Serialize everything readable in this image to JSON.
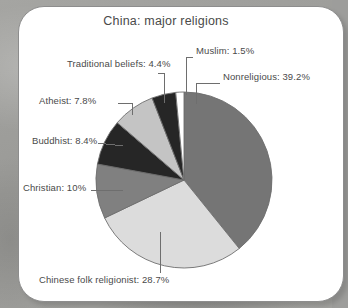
{
  "chart_data": {
    "type": "pie",
    "title": "China: major religions",
    "xlabel": "",
    "ylabel": "",
    "units": "percent",
    "legend_position": "none-callout-labels",
    "grid": false,
    "start_angle_deg": 0,
    "direction": "clockwise",
    "categories": [
      "Nonreligious",
      "Chinese folk religionist",
      "Christian",
      "Buddhist",
      "Atheist",
      "Traditional beliefs",
      "Muslim"
    ],
    "values": [
      39.2,
      28.7,
      10,
      8.4,
      7.8,
      4.4,
      1.5
    ],
    "slices": [
      {
        "label": "Nonreligious",
        "value": 39.2,
        "value_text": "39.2%",
        "callout": "Nonreligious: 39.2%",
        "color": "#757575"
      },
      {
        "label": "Chinese folk religionist",
        "value": 28.7,
        "value_text": "28.7%",
        "callout": "Chinese folk religionist: 28.7%",
        "color": "#dcdcdc"
      },
      {
        "label": "Christian",
        "value": 10,
        "value_text": "10%",
        "callout": "Christian: 10%",
        "color": "#808080"
      },
      {
        "label": "Buddhist",
        "value": 8.4,
        "value_text": "8.4%",
        "callout": "Buddhist: 8.4%",
        "color": "#262626"
      },
      {
        "label": "Atheist",
        "value": 7.8,
        "value_text": "7.8%",
        "callout": "Atheist: 7.8%",
        "color": "#c4c4c4"
      },
      {
        "label": "Traditional beliefs",
        "value": 4.4,
        "value_text": "4.4%",
        "callout": "Traditional beliefs: 4.4%",
        "color": "#262626"
      },
      {
        "label": "Muslim",
        "value": 1.5,
        "value_text": "1.5%",
        "callout": "Muslim: 1.5%",
        "color": "#ffffff"
      }
    ],
    "colors": {
      "leader_line": "#6e6e6e",
      "slice_outline": "#6e6e6e",
      "label_text": "#4a4a4a",
      "card_background": "#ffffff",
      "card_border": "#8d8d8d",
      "page_background": "#9d9d9b"
    }
  }
}
